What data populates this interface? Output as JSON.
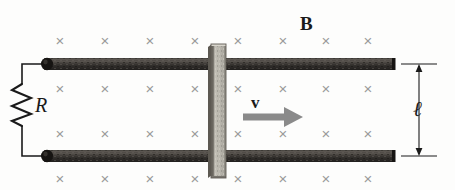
{
  "figure": {
    "background_color": "#fdfdfc"
  },
  "labels": {
    "magnetic_field": "B",
    "resistor": "R",
    "velocity": "v",
    "length": "ℓ"
  },
  "colors": {
    "rail": "#2e2b29",
    "rail_highlight": "#4d4845",
    "bar_face": "#b9b6ad",
    "bar_edge": "#6e6a63",
    "wire": "#1a1a1a",
    "xmark": "#9a9a9a",
    "arrow": "#8a8a8a",
    "dimension": "#1a1a1a"
  },
  "field_marks": {
    "symbol": "×",
    "meaning": "magnetic-field-into-page",
    "columns": [
      60,
      105,
      150,
      195,
      238,
      283,
      326,
      368
    ],
    "rows": [
      40,
      88,
      133,
      178
    ],
    "count": 32
  },
  "geometry": {
    "top_rail": {
      "x1": 44,
      "x2": 395,
      "y": 64,
      "thickness": 12
    },
    "bottom_rail": {
      "x1": 44,
      "x2": 395,
      "y": 156,
      "thickness": 12
    },
    "slider_bar": {
      "x": 210,
      "y_top": 45,
      "y_bottom": 178,
      "width": 15
    },
    "resistor": {
      "x": 22,
      "y_top": 82,
      "y_bottom": 128,
      "peaks": 5
    },
    "velocity_arrow": {
      "x1": 243,
      "x2": 301,
      "y": 117
    },
    "dimension_arrow": {
      "x": 419,
      "y_top": 64,
      "y_bottom": 156
    }
  }
}
